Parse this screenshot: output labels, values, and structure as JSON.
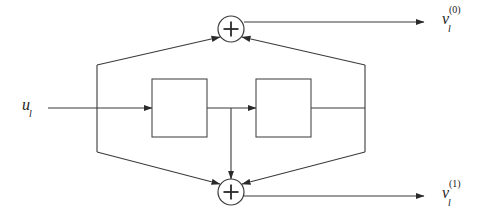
{
  "figure": {
    "type": "block-diagram",
    "background_color": "#ffffff",
    "line_color": "#3a3a3a"
  },
  "labels": {
    "input": {
      "base": "u",
      "subscript": "l",
      "superscript": ""
    },
    "output_top": {
      "base": "v",
      "subscript": "l",
      "superscript": "(0)"
    },
    "output_bottom": {
      "base": "v",
      "subscript": "l",
      "superscript": "(1)"
    }
  },
  "adders": [
    {
      "name": "top-adder",
      "symbol": "+",
      "cx": 231,
      "cy": 29,
      "r": 13
    },
    {
      "name": "bottom-adder",
      "symbol": "+",
      "cx": 231,
      "cy": 192,
      "r": 13
    }
  ],
  "blocks": [
    {
      "name": "first-block",
      "label": "",
      "x": 152,
      "y": 79,
      "width": 55,
      "height": 58
    },
    {
      "name": "second-block",
      "label": "",
      "x": 256,
      "y": 79,
      "width": 55,
      "height": 58
    }
  ],
  "nodes": {
    "left_tap_x": 97,
    "right_tap_x": 365,
    "mid_tap_x": 231,
    "signal_line_y": 108,
    "top_rail_y": 65,
    "bottom_rail_y": 152,
    "top_out_y": 22,
    "bottom_out_y": 196,
    "arrow_end_x": 418
  }
}
